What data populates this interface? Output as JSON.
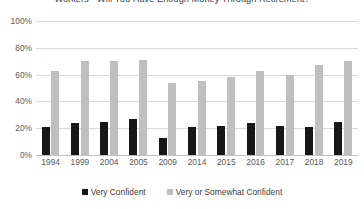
{
  "chart_data": {
    "type": "bar",
    "title": "Workers - Will You Have Enough Money Through Retirement?",
    "xlabel": "",
    "ylabel": "",
    "ylim": [
      0,
      100
    ],
    "yticks": [
      "0%",
      "20%",
      "40%",
      "60%",
      "80%",
      "100%"
    ],
    "ytick_values": [
      0,
      20,
      40,
      60,
      80,
      100
    ],
    "grid": true,
    "legend_position": "bottom",
    "categories": [
      "1994",
      "1999",
      "2004",
      "2005",
      "2009",
      "2014",
      "2015",
      "2016",
      "2017",
      "2018",
      "2019"
    ],
    "series": [
      {
        "name": "Very Confident",
        "color": "#171717",
        "values": [
          21,
          24,
          25,
          27,
          13,
          21,
          22,
          24,
          22,
          21,
          25
        ]
      },
      {
        "name": "Very or Somewhat Confident",
        "color": "#bfbfbf",
        "values": [
          63,
          70,
          70,
          71,
          54,
          55,
          58,
          63,
          60,
          67,
          70
        ]
      }
    ]
  },
  "legend": {
    "items": [
      {
        "label": "Very Confident"
      },
      {
        "label": "Very or Somewhat Confident"
      }
    ]
  }
}
